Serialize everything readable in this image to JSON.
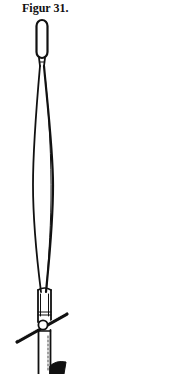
{
  "figure": {
    "caption": "Figur 31.",
    "ink_color": "#111111",
    "background_color": "#ffffff",
    "parts": [
      "top-loop",
      "spindle-body",
      "collar",
      "crossbar-handle",
      "pivot-knob",
      "lower-shaft"
    ]
  }
}
